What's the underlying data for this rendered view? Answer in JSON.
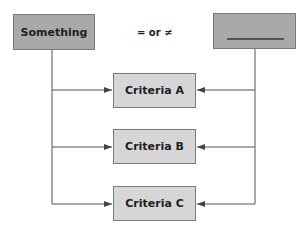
{
  "diagram": {
    "left_box": {
      "label": "Something"
    },
    "right_box": {
      "label": "",
      "blank": true
    },
    "relation": "= or ≠",
    "criteria": [
      {
        "label": "Criteria A"
      },
      {
        "label": "Criteria B"
      },
      {
        "label": "Criteria C"
      }
    ],
    "colors": {
      "dark_box": "#a9a9a9",
      "light_box": "#d6d6d6",
      "line": "#555555"
    }
  }
}
